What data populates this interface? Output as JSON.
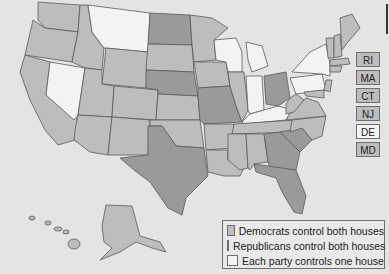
{
  "legend": {
    "items": [
      {
        "key": "dem",
        "label": "Democrats control both houses",
        "color": "#bdbdbd"
      },
      {
        "key": "rep",
        "label": "Republicans control both houses",
        "color": "#9a9a9a"
      },
      {
        "key": "split",
        "label": "Each party controls one house",
        "color": "#f3f3f3"
      }
    ]
  },
  "small_states": [
    {
      "abbr": "RI",
      "control": "dem"
    },
    {
      "abbr": "MA",
      "control": "dem"
    },
    {
      "abbr": "CT",
      "control": "dem"
    },
    {
      "abbr": "NJ",
      "control": "dem"
    },
    {
      "abbr": "DE",
      "control": "split"
    },
    {
      "abbr": "MD",
      "control": "dem"
    }
  ],
  "colors": {
    "dem": "#bdbdbd",
    "rep": "#9a9a9a",
    "split": "#f3f3f3",
    "background": "#e4e4e4"
  }
}
